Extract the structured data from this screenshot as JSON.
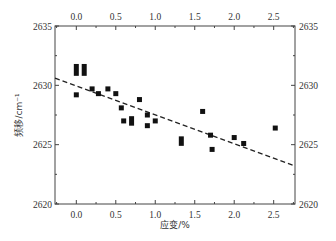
{
  "chart_data": {
    "type": "scatter",
    "title": "",
    "xlabel": "应变/%",
    "ylabel": "频移/cm⁻¹",
    "xlim": [
      -0.27,
      2.77
    ],
    "ylim": [
      2620,
      2635
    ],
    "x_ticks": [
      0.0,
      0.5,
      1.0,
      1.5,
      2.0,
      2.5
    ],
    "x_tick_labels": [
      "0.0",
      "0.5",
      "1.0",
      "1.5",
      "2.0",
      "2.5"
    ],
    "y_ticks": [
      2620,
      2625,
      2630,
      2635
    ],
    "y_tick_labels": [
      "2620",
      "2625",
      "2630",
      "2635"
    ],
    "mirror_axes": true,
    "grid": false,
    "legend": null,
    "series": [
      {
        "name": "measured",
        "marker": "square",
        "color": "#111111",
        "points": [
          {
            "x": 0.0,
            "y": 2631.3,
            "yerr": 0.5
          },
          {
            "x": 0.1,
            "y": 2631.3,
            "yerr": 0.5
          },
          {
            "x": 0.0,
            "y": 2629.2
          },
          {
            "x": 0.2,
            "y": 2629.7
          },
          {
            "x": 0.28,
            "y": 2629.3
          },
          {
            "x": 0.4,
            "y": 2629.7
          },
          {
            "x": 0.5,
            "y": 2629.3
          },
          {
            "x": 0.57,
            "y": 2628.1
          },
          {
            "x": 0.6,
            "y": 2627.0
          },
          {
            "x": 0.7,
            "y": 2627.0,
            "yerr": 0.4
          },
          {
            "x": 0.8,
            "y": 2628.8
          },
          {
            "x": 0.9,
            "y": 2626.6
          },
          {
            "x": 0.9,
            "y": 2627.5
          },
          {
            "x": 1.0,
            "y": 2627.0
          },
          {
            "x": 1.33,
            "y": 2625.3,
            "yerr": 0.4
          },
          {
            "x": 1.6,
            "y": 2627.8
          },
          {
            "x": 1.7,
            "y": 2625.8
          },
          {
            "x": 1.72,
            "y": 2624.6
          },
          {
            "x": 2.0,
            "y": 2625.6
          },
          {
            "x": 2.12,
            "y": 2625.1
          },
          {
            "x": 2.52,
            "y": 2626.4
          }
        ]
      },
      {
        "name": "linear fit",
        "type": "line",
        "style": "dashed",
        "color": "#222222",
        "x": [
          -0.27,
          2.77
        ],
        "y": [
          2630.6,
          2623.2
        ]
      }
    ]
  }
}
